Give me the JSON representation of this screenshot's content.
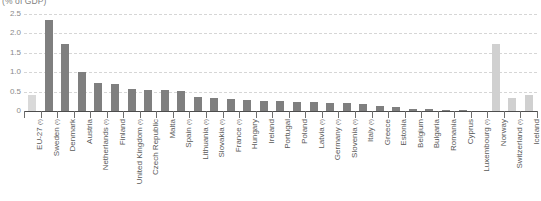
{
  "subtitle": "(% of GDP)",
  "colors": {
    "eu_aggregate": "#d9d9d9",
    "member_state": "#7f7f7f",
    "non_member": "#d0d0d0",
    "gridline": "#d6d6d6",
    "axis": "#4d4d4d",
    "label_text": "#595959"
  },
  "chart_data": {
    "type": "bar",
    "title": "",
    "subtitle": "(% of GDP)",
    "xlabel": "",
    "ylabel": "",
    "ylim": [
      0,
      2.5
    ],
    "grid": true,
    "legend_position": "none",
    "ytick_labels": [
      "0",
      "0.5",
      "1.0",
      "1.5",
      "2.0",
      "2.5"
    ],
    "ytick_values": [
      0,
      0.5,
      1.0,
      1.5,
      2.0,
      2.5
    ],
    "categories": [
      "EU-27 (¹)",
      "Sweden (¹)",
      "Denmark",
      "Austria",
      "Netherlands (¹)",
      "Finland",
      "United Kingdom (¹)",
      "Czech Republic",
      "Malta",
      "Spain (¹)",
      "Lithuania (¹)",
      "Slovakia (¹)",
      "France (¹)",
      "Hungary",
      "Ireland",
      "Portugal",
      "Poland",
      "Latvia (¹)",
      "Germany (¹)",
      "Slovenia (¹)",
      "Italy (¹)",
      "Greece",
      "Estonia",
      "Belgium",
      "Bulgaria",
      "Romania",
      "Cyprus",
      "Luxembourg (¹)",
      "Norway",
      "Switzerland (¹)",
      "Iceland"
    ],
    "values": [
      0.42,
      2.35,
      1.72,
      1.0,
      0.72,
      0.69,
      0.57,
      0.55,
      0.53,
      0.52,
      0.36,
      0.34,
      0.3,
      0.28,
      0.26,
      0.25,
      0.24,
      0.22,
      0.21,
      0.2,
      0.19,
      0.12,
      0.11,
      0.05,
      0.04,
      0.03,
      0.02,
      0.0,
      1.72,
      0.34,
      0.4
    ],
    "series_kinds": [
      "eu",
      "member",
      "member",
      "member",
      "member",
      "member",
      "member",
      "member",
      "member",
      "member",
      "member",
      "member",
      "member",
      "member",
      "member",
      "member",
      "member",
      "member",
      "member",
      "member",
      "member",
      "member",
      "member",
      "member",
      "member",
      "member",
      "member",
      "member",
      "nonmember",
      "nonmember",
      "nonmember"
    ]
  }
}
